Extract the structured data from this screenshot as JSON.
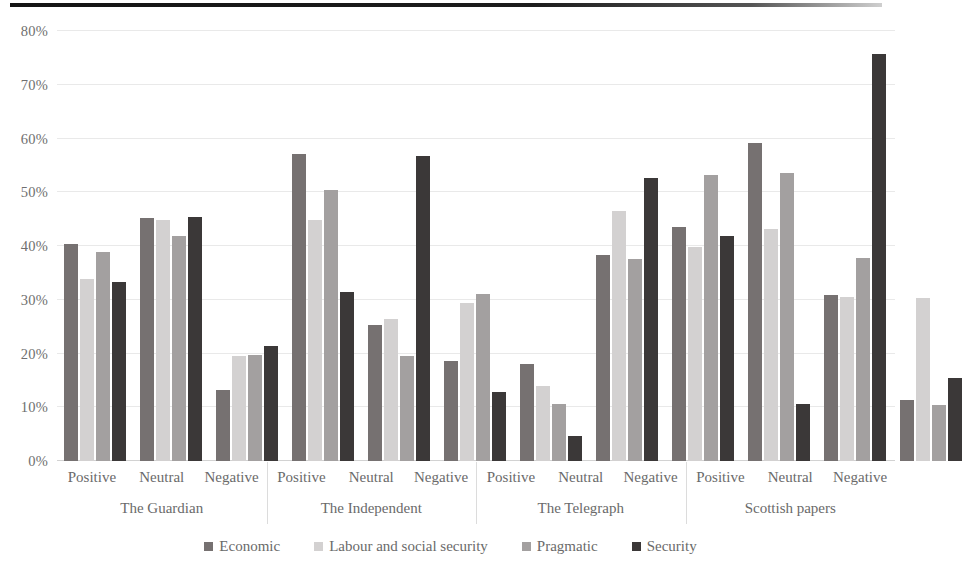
{
  "chart_data": {
    "type": "bar",
    "title": "",
    "xlabel": "",
    "ylabel": "",
    "ylim": [
      0,
      80
    ],
    "y_tick_labels": [
      "80%",
      "70%",
      "60%",
      "50%",
      "40%",
      "30%",
      "20%",
      "10%",
      "0%"
    ],
    "y_tick_values": [
      80,
      70,
      60,
      50,
      40,
      30,
      20,
      10,
      0
    ],
    "grid": true,
    "legend_position": "bottom",
    "legend": [
      "Economic",
      "Labour and social security",
      "Pragmatic",
      "Security"
    ],
    "series_colors": [
      "#767171",
      "#d3d1d1",
      "#a3a0a0",
      "#3b3838"
    ],
    "group_level_1": [
      "The Guardian",
      "The Independent",
      "The Telegraph",
      "Scottish papers"
    ],
    "group_level_2": [
      "Positive",
      "Neutral",
      "Negative"
    ],
    "categories": [
      "The Guardian / Positive",
      "The Guardian / Neutral",
      "The Guardian / Negative",
      "The Independent / Positive",
      "The Independent / Neutral",
      "The Independent / Negative",
      "The Telegraph / Positive",
      "The Telegraph / Neutral",
      "The Telegraph / Negative",
      "Scottish papers / Positive",
      "Scottish papers / Neutral",
      "Scottish papers / Negative"
    ],
    "series": [
      {
        "name": "Economic",
        "color": "#767171",
        "values": [
          40.3,
          45.3,
          13.2,
          57.2,
          25.3,
          18.6,
          18.1,
          38.4,
          43.5,
          59.2,
          30.8,
          11.4
        ]
      },
      {
        "name": "Labour and social security",
        "color": "#d3d1d1",
        "values": [
          33.9,
          44.9,
          19.5,
          44.9,
          26.4,
          29.4,
          14.0,
          46.5,
          39.8,
          43.2,
          30.5,
          30.4
        ]
      },
      {
        "name": "Pragmatic",
        "color": "#a3a0a0",
        "values": [
          38.9,
          41.8,
          19.7,
          50.4,
          19.5,
          31.0,
          10.6,
          37.6,
          53.2,
          53.6,
          37.7,
          10.4
        ]
      },
      {
        "name": "Security",
        "color": "#3b3838",
        "values": [
          33.3,
          45.4,
          21.4,
          31.5,
          56.7,
          12.8,
          4.7,
          52.6,
          41.8,
          10.6,
          75.8,
          15.5
        ]
      }
    ],
    "groups": [
      {
        "paper": "The Guardian",
        "sentiments": [
          {
            "label": "Positive",
            "bars": [
              {
                "series": "Economic",
                "value": 40.3,
                "color": "#767171"
              },
              {
                "series": "Labour and social security",
                "value": 33.9,
                "color": "#d3d1d1"
              },
              {
                "series": "Pragmatic",
                "value": 38.9,
                "color": "#a3a0a0"
              },
              {
                "series": "Security",
                "value": 33.3,
                "color": "#3b3838"
              }
            ]
          },
          {
            "label": "Neutral",
            "bars": [
              {
                "series": "Economic",
                "value": 45.3,
                "color": "#767171"
              },
              {
                "series": "Labour and social security",
                "value": 44.9,
                "color": "#d3d1d1"
              },
              {
                "series": "Pragmatic",
                "value": 41.8,
                "color": "#a3a0a0"
              },
              {
                "series": "Security",
                "value": 45.4,
                "color": "#3b3838"
              }
            ]
          },
          {
            "label": "Negative",
            "bars": [
              {
                "series": "Economic",
                "value": 13.2,
                "color": "#767171"
              },
              {
                "series": "Labour and social security",
                "value": 19.5,
                "color": "#d3d1d1"
              },
              {
                "series": "Pragmatic",
                "value": 19.7,
                "color": "#a3a0a0"
              },
              {
                "series": "Security",
                "value": 21.4,
                "color": "#3b3838"
              }
            ]
          }
        ]
      },
      {
        "paper": "The Independent",
        "sentiments": [
          {
            "label": "Positive",
            "bars": [
              {
                "series": "Economic",
                "value": 57.2,
                "color": "#767171"
              },
              {
                "series": "Labour and social security",
                "value": 44.9,
                "color": "#d3d1d1"
              },
              {
                "series": "Pragmatic",
                "value": 50.4,
                "color": "#a3a0a0"
              },
              {
                "series": "Security",
                "value": 31.5,
                "color": "#3b3838"
              }
            ]
          },
          {
            "label": "Neutral",
            "bars": [
              {
                "series": "Economic",
                "value": 25.3,
                "color": "#767171"
              },
              {
                "series": "Labour and social security",
                "value": 26.4,
                "color": "#d3d1d1"
              },
              {
                "series": "Pragmatic",
                "value": 19.5,
                "color": "#a3a0a0"
              },
              {
                "series": "Security",
                "value": 56.7,
                "color": "#3b3838"
              }
            ]
          },
          {
            "label": "Negative",
            "bars": [
              {
                "series": "Economic",
                "value": 18.6,
                "color": "#767171"
              },
              {
                "series": "Labour and social security",
                "value": 29.4,
                "color": "#d3d1d1"
              },
              {
                "series": "Pragmatic",
                "value": 31.0,
                "color": "#a3a0a0"
              },
              {
                "series": "Security",
                "value": 12.8,
                "color": "#3b3838"
              }
            ]
          }
        ]
      },
      {
        "paper": "The Telegraph",
        "sentiments": [
          {
            "label": "Positive",
            "bars": [
              {
                "series": "Economic",
                "value": 18.1,
                "color": "#767171"
              },
              {
                "series": "Labour and social security",
                "value": 14.0,
                "color": "#d3d1d1"
              },
              {
                "series": "Pragmatic",
                "value": 10.6,
                "color": "#a3a0a0"
              },
              {
                "series": "Security",
                "value": 4.7,
                "color": "#3b3838"
              }
            ]
          },
          {
            "label": "Neutral",
            "bars": [
              {
                "series": "Economic",
                "value": 38.4,
                "color": "#767171"
              },
              {
                "series": "Labour and social security",
                "value": 46.5,
                "color": "#d3d1d1"
              },
              {
                "series": "Pragmatic",
                "value": 37.6,
                "color": "#a3a0a0"
              },
              {
                "series": "Security",
                "value": 52.6,
                "color": "#3b3838"
              }
            ]
          },
          {
            "label": "Negative",
            "bars": [
              {
                "series": "Economic",
                "value": 43.5,
                "color": "#767171"
              },
              {
                "series": "Labour and social security",
                "value": 39.8,
                "color": "#d3d1d1"
              },
              {
                "series": "Pragmatic",
                "value": 53.2,
                "color": "#a3a0a0"
              },
              {
                "series": "Security",
                "value": 41.8,
                "color": "#3b3838"
              }
            ]
          }
        ]
      },
      {
        "paper": "Scottish papers",
        "sentiments": [
          {
            "label": "Positive",
            "bars": [
              {
                "series": "Economic",
                "value": 59.2,
                "color": "#767171"
              },
              {
                "series": "Labour and social security",
                "value": 43.2,
                "color": "#d3d1d1"
              },
              {
                "series": "Pragmatic",
                "value": 53.6,
                "color": "#a3a0a0"
              },
              {
                "series": "Security",
                "value": 10.6,
                "color": "#3b3838"
              }
            ]
          },
          {
            "label": "Neutral",
            "bars": [
              {
                "series": "Economic",
                "value": 30.8,
                "color": "#767171"
              },
              {
                "series": "Labour and social security",
                "value": 30.5,
                "color": "#d3d1d1"
              },
              {
                "series": "Pragmatic",
                "value": 37.7,
                "color": "#a3a0a0"
              },
              {
                "series": "Security",
                "value": 75.8,
                "color": "#3b3838"
              }
            ]
          },
          {
            "label": "Negative",
            "bars": [
              {
                "series": "Economic",
                "value": 11.4,
                "color": "#767171"
              },
              {
                "series": "Labour and social security",
                "value": 30.4,
                "color": "#d3d1d1"
              },
              {
                "series": "Pragmatic",
                "value": 10.4,
                "color": "#a3a0a0"
              },
              {
                "series": "Security",
                "value": 15.5,
                "color": "#3b3838"
              }
            ]
          }
        ]
      }
    ]
  }
}
